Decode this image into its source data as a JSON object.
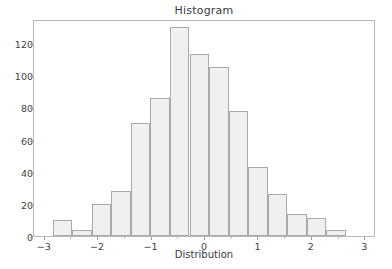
{
  "chart_data": {
    "type": "bar",
    "title": "Histogram",
    "xlabel": "Distribution",
    "ylabel": "",
    "xlim": [
      -3.2,
      3.2
    ],
    "ylim": [
      0,
      135
    ],
    "grid": false,
    "legend": null,
    "bin_edges": [
      -2.85,
      -2.48,
      -2.12,
      -1.75,
      -1.39,
      -1.02,
      -0.66,
      -0.29,
      0.07,
      0.44,
      0.8,
      1.17,
      1.53,
      1.9,
      2.26,
      2.63,
      3.0
    ],
    "categories": [
      "-2.85 to -2.48",
      "-2.48 to -2.12",
      "-2.12 to -1.75",
      "-1.75 to -1.39",
      "-1.39 to -1.02",
      "-1.02 to -0.66",
      "-0.66 to -0.29",
      "-0.29 to 0.07",
      "0.07 to 0.44",
      "0.44 to 0.80",
      "0.80 to 1.17",
      "1.17 to 1.53",
      "1.53 to 1.90",
      "1.90 to 2.26",
      "2.26 to 2.63",
      "2.63 to 3.00"
    ],
    "values": [
      10,
      4,
      20,
      28,
      70,
      86,
      130,
      113,
      105,
      78,
      43,
      26,
      14,
      11,
      4,
      0
    ],
    "xticks": [
      -3,
      -2,
      -1,
      0,
      1,
      2,
      3
    ],
    "xtick_labels": [
      "−3",
      "−2",
      "−1",
      "0",
      "1",
      "2",
      "3"
    ],
    "yticks": [
      0,
      20,
      40,
      60,
      80,
      100,
      120
    ],
    "ytick_labels": [
      "0",
      "20",
      "40",
      "60",
      "80",
      "100",
      "120"
    ],
    "bar_fill_color": "#f0f0f0",
    "bar_edge_color": "#a9a9a9",
    "axes_color": "#b8b8b8",
    "text_color": "#3a3a3a"
  }
}
